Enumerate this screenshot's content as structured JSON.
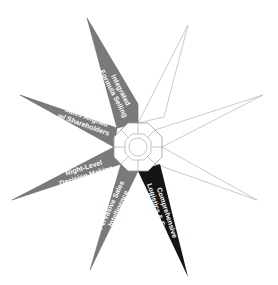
{
  "diagram": {
    "type": "eight-point-star",
    "center": {
      "shape": "octagon",
      "segments": 8
    },
    "colors": {
      "gray": "#7a7a7a",
      "black": "#141414",
      "white": "#ffffff",
      "outline": "#bdbdbd"
    },
    "points": [
      {
        "id": "p1",
        "position": "top-left",
        "fill": "gray",
        "line1": "Integrated",
        "line2": "Formula Selling"
      },
      {
        "id": "p2",
        "position": "top-right",
        "fill": "white",
        "line1": "",
        "line2": ""
      },
      {
        "id": "p3",
        "position": "right-upper",
        "fill": "white",
        "line1": "",
        "line2": ""
      },
      {
        "id": "p4",
        "position": "right-lower",
        "fill": "white",
        "line1": "",
        "line2": ""
      },
      {
        "id": "p5",
        "position": "bottom-right",
        "fill": "black",
        "line1": "Comprehensive",
        "line2": "Logistics & Support"
      },
      {
        "id": "p6",
        "position": "bottom-left",
        "fill": "gray",
        "line1": "Pervasive Sales",
        "line2": "Intelligence"
      },
      {
        "id": "p7",
        "position": "left-lower",
        "fill": "gray",
        "line1": "Right-Level",
        "line2": "Decision Making"
      },
      {
        "id": "p8",
        "position": "left-upper",
        "fill": "gray",
        "line1": "Sales Aligned",
        "line2": "w/ Shareholders"
      }
    ]
  }
}
